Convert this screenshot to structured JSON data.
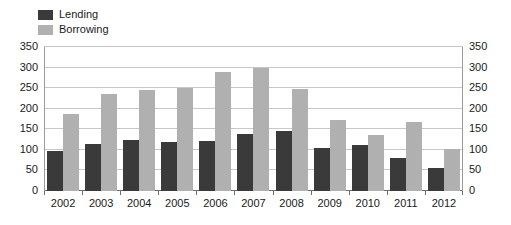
{
  "chart_data": {
    "type": "bar",
    "title": "",
    "subtitle": "",
    "xlabel": "",
    "ylabel": "",
    "categories": [
      "2002",
      "2003",
      "2004",
      "2005",
      "2006",
      "2007",
      "2008",
      "2009",
      "2010",
      "2011",
      "2012"
    ],
    "series": [
      {
        "name": "Lending",
        "color": "#3a3a3a",
        "values": [
          97,
          114,
          123,
          118,
          122,
          139,
          145,
          105,
          112,
          80,
          57
        ]
      },
      {
        "name": "Borrowing",
        "color": "#b0b0b0",
        "values": [
          186,
          237,
          246,
          250,
          290,
          299,
          248,
          173,
          137,
          168,
          103
        ]
      }
    ],
    "ylim": [
      0,
      350
    ],
    "ytick_values": [
      0,
      50,
      100,
      150,
      200,
      250,
      300,
      350
    ],
    "ytick_labels_left": [
      "0",
      "50",
      "100",
      "150",
      "200",
      "250",
      "300",
      "350"
    ],
    "ytick_labels_right": [
      "0",
      "50",
      "100",
      "150",
      "200",
      "250",
      "300",
      "350"
    ],
    "right_axis": true,
    "grid": true,
    "grid_axis": "y",
    "legend_position": "top-left",
    "annotations": []
  },
  "legend": {
    "entries": [
      {
        "label": "Lending",
        "color": "#3a3a3a"
      },
      {
        "label": "Borrowing",
        "color": "#b0b0b0"
      }
    ]
  },
  "colors": {
    "lending": "#3a3a3a",
    "borrowing": "#b0b0b0",
    "gridline": "#c8c8c8",
    "axis": "#9a9a9a",
    "baseline": "#6e6e6e",
    "text": "#1a1a1a",
    "background": "#ffffff"
  }
}
